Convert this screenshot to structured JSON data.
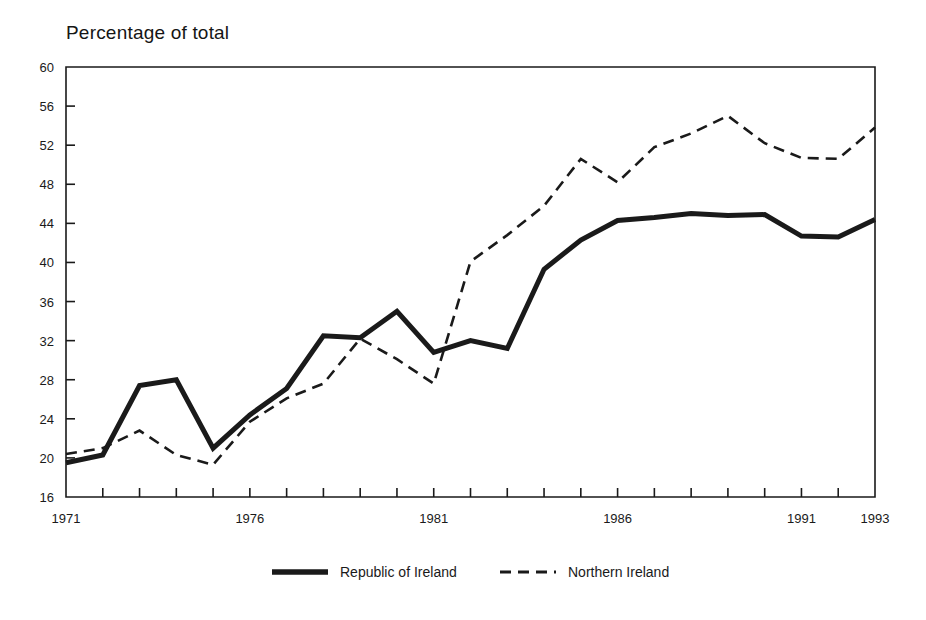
{
  "chart_data": {
    "type": "line",
    "title": "Percentage of total",
    "xlabel": "",
    "ylabel": "Percentage of total",
    "ylim": [
      16,
      60
    ],
    "xlim": [
      1971,
      1993
    ],
    "ytick_step": 4,
    "grid": false,
    "legend_position": "bottom",
    "yticks": [
      16,
      20,
      24,
      28,
      32,
      36,
      40,
      44,
      48,
      52,
      56,
      60
    ],
    "ytick_labels": [
      "16",
      "20",
      "24",
      "28",
      "32",
      "36",
      "40",
      "44",
      "48",
      "52",
      "56",
      "60"
    ],
    "x": [
      1971,
      1972,
      1973,
      1974,
      1975,
      1976,
      1977,
      1978,
      1979,
      1980,
      1981,
      1982,
      1983,
      1984,
      1985,
      1986,
      1987,
      1988,
      1989,
      1990,
      1991,
      1992,
      1993
    ],
    "xtick_labels": [
      "1971",
      "1976",
      "1981",
      "1986",
      "1991",
      "1993"
    ],
    "xtick_label_years": [
      1971,
      1976,
      1981,
      1986,
      1991,
      1993
    ],
    "series": [
      {
        "name": "Republic of Ireland",
        "style": "solid",
        "color": "#1a1a1a",
        "width": 5,
        "values": [
          19.5,
          20.3,
          27.4,
          28.0,
          21.0,
          24.4,
          27.1,
          32.5,
          32.3,
          35.0,
          30.8,
          32.0,
          31.2,
          39.3,
          42.3,
          44.3,
          44.6,
          45.0,
          44.8,
          44.9,
          42.7,
          42.6,
          44.4
        ]
      },
      {
        "name": "Northern Ireland",
        "style": "dashed",
        "color": "#1a1a1a",
        "width": 2.6,
        "values": [
          20.4,
          21.0,
          22.8,
          20.3,
          19.3,
          23.7,
          26.1,
          27.6,
          32.2,
          30.1,
          27.6,
          40.1,
          42.8,
          45.8,
          50.6,
          48.2,
          51.8,
          53.2,
          55.0,
          52.2,
          50.7,
          50.6,
          53.8
        ]
      }
    ]
  },
  "legend": {
    "items": [
      {
        "label": "Republic of Ireland",
        "style": "solid"
      },
      {
        "label": "Northern Ireland",
        "style": "dashed"
      }
    ]
  }
}
